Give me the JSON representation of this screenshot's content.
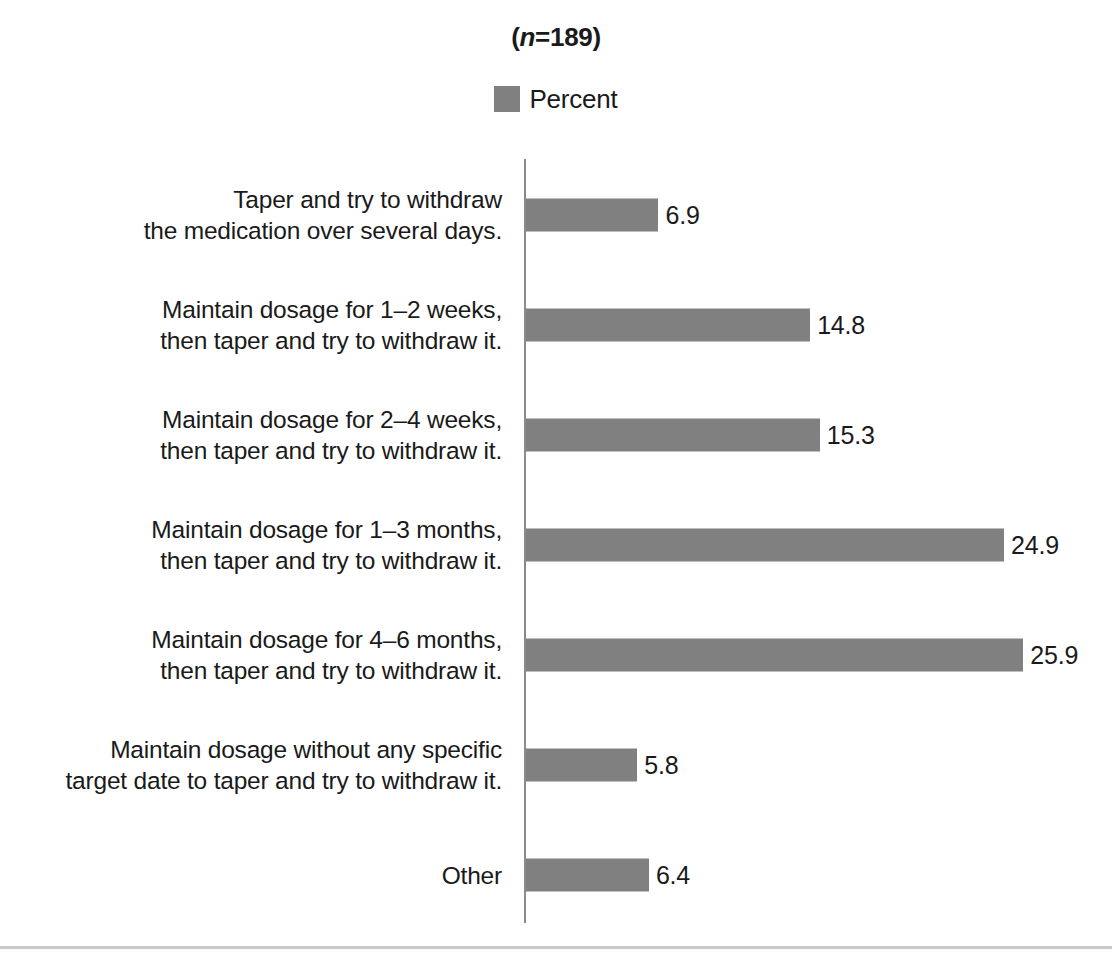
{
  "chart_data": {
    "type": "bar",
    "orientation": "horizontal",
    "title": "(n=189)",
    "title_prefix": "(",
    "title_italic": "n",
    "title_suffix": "=189)",
    "xlabel": "",
    "ylabel": "",
    "grid": false,
    "legend_position": "top-center",
    "legend": [
      "Percent"
    ],
    "series": [
      {
        "name": "Percent",
        "color": "#808080",
        "values": [
          6.9,
          14.8,
          15.3,
          24.9,
          25.9,
          5.8,
          6.4
        ]
      }
    ],
    "categories": [
      "Taper and try to withdraw\nthe medication over several days.",
      "Maintain dosage for 1–2 weeks,\nthen taper and try to withdraw it.",
      "Maintain dosage for 2–4 weeks,\nthen taper and try to withdraw it.",
      "Maintain dosage for 1–3 months,\nthen taper and try to withdraw it.",
      "Maintain dosage for 4–6 months,\nthen taper and try to withdraw it.",
      "Maintain dosage without any specific\ntarget date to taper and try to withdraw it.",
      "Other"
    ],
    "value_labels": [
      "6.9",
      "14.8",
      "15.3",
      "24.9",
      "25.9",
      "5.8",
      "6.4"
    ],
    "xlim": [
      0,
      30
    ],
    "px_per_unit": 19.2
  },
  "colors": {
    "bar": "#808080",
    "axis": "#8a8a8a",
    "text": "#1a1a1a",
    "rule": "#c9c9c9",
    "background": "#ffffff"
  }
}
